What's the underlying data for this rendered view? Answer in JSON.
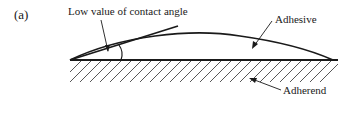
{
  "figure": {
    "panel_label": "(a)",
    "annotations": {
      "contact_angle": "Low value of contact angle",
      "adhesive": "Adhesive",
      "adherend": "Adherend"
    },
    "colors": {
      "line": "#1a1a1a",
      "background": "#ffffff"
    }
  }
}
